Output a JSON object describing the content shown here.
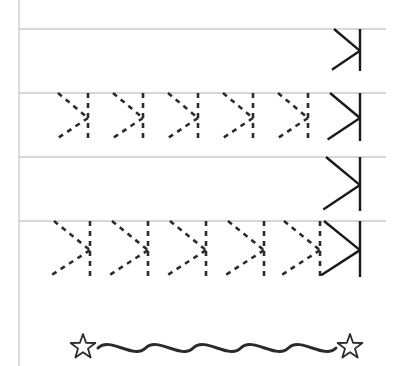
{
  "worksheet": {
    "type": "handwriting-tracing-worksheet",
    "width": 395,
    "height": 366,
    "background_color": "#ffffff",
    "letter": {
      "name": "reversed-k",
      "description": "mirrored capital K: vertical stem at right with two diagonal arms opening to the left",
      "stroke_color": "#1a1a1a"
    },
    "margin_line": {
      "name": "left-margin-line",
      "x": 19,
      "y_top": 0,
      "y_bottom": 366,
      "color": "#b8b8b8",
      "width": 1
    },
    "baselines": {
      "color": "#b0b0b0",
      "width": 1,
      "x_start": 19,
      "x_end": 386,
      "y_values": [
        29,
        93,
        157,
        221
      ]
    },
    "rows": [
      {
        "index": 1,
        "name": "practice-row-1",
        "baseline_y": 29,
        "glyph_height": 42,
        "glyph_width": 26,
        "dashed_count": 0,
        "dashed_x": [],
        "model_x": 360,
        "has_model": true
      },
      {
        "index": 2,
        "name": "practice-row-2",
        "baseline_y": 93,
        "glyph_height": 48,
        "glyph_width": 30,
        "dashed_count": 5,
        "dashed_x": [
          88,
          143,
          198,
          253,
          308
        ],
        "model_x": 360,
        "has_model": true
      },
      {
        "index": 3,
        "name": "practice-row-3",
        "baseline_y": 157,
        "glyph_height": 54,
        "glyph_width": 34,
        "dashed_count": 0,
        "dashed_x": [],
        "model_x": 360,
        "has_model": true
      },
      {
        "index": 4,
        "name": "practice-row-4",
        "baseline_y": 221,
        "glyph_height": 56,
        "glyph_width": 36,
        "dashed_count": 5,
        "dashed_x": [
          90,
          148,
          206,
          264,
          320
        ],
        "model_x": 360,
        "has_model": true
      }
    ],
    "dashed_style": {
      "color": "#2b2b2b",
      "width": 2.6,
      "dash_pattern": "5 5"
    },
    "solid_style": {
      "color": "#1a1a1a",
      "width": 2.4
    },
    "decoration": {
      "name": "wavy-divider-with-stars",
      "wave": {
        "color": "#2b2b2b",
        "width": 3,
        "x_start": 98,
        "x_end": 336,
        "center_y": 348,
        "amplitude": 6,
        "periods": 5
      },
      "stars": [
        {
          "name": "star-left",
          "cx": 83,
          "cy": 347,
          "outer_r": 13,
          "inner_r": 5.2
        },
        {
          "name": "star-right",
          "cx": 350,
          "cy": 347,
          "outer_r": 13,
          "inner_r": 5.2
        }
      ],
      "star_style": {
        "fill": "#ffffff",
        "stroke": "#2b2b2b",
        "stroke_width": 1.8
      }
    }
  }
}
